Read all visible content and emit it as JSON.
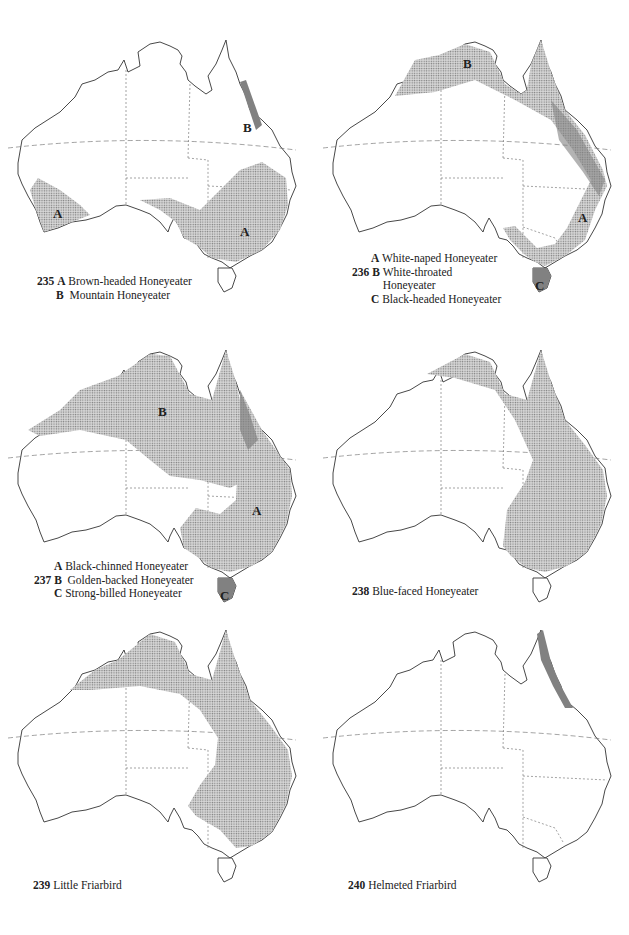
{
  "page": {
    "background": "#ffffff",
    "ink": "#222222",
    "shade": "#9a9a9a"
  },
  "maps": [
    {
      "id": 235,
      "number": "235",
      "captions": [
        {
          "letter": "A",
          "name": "Brown-headed Honeyeater"
        },
        {
          "letter": "B",
          "name": "Mountain Honeyeater"
        }
      ],
      "labels": [
        "A",
        "B",
        "A"
      ]
    },
    {
      "id": 236,
      "number": "236",
      "captions": [
        {
          "letter": "A",
          "name": "White-naped Honeyeater"
        },
        {
          "letter": "B",
          "name": "White-throated Honeyeater"
        },
        {
          "letter": "C",
          "name": "Black-headed Honeyeater"
        }
      ],
      "labels": [
        "B",
        "A",
        "C"
      ]
    },
    {
      "id": 237,
      "number": "237",
      "captions": [
        {
          "letter": "A",
          "name": "Black-chinned Honeyeater"
        },
        {
          "letter": "B",
          "name": "Golden-backed Honeyeater"
        },
        {
          "letter": "C",
          "name": "Strong-billed Honeyeater"
        }
      ],
      "labels": [
        "B",
        "A",
        "C"
      ]
    },
    {
      "id": 238,
      "number": "238",
      "captions": [
        {
          "letter": "",
          "name": "Blue-faced Honeyeater"
        }
      ],
      "labels": []
    },
    {
      "id": 239,
      "number": "239",
      "captions": [
        {
          "letter": "",
          "name": "Little Friarbird"
        }
      ],
      "labels": []
    },
    {
      "id": 240,
      "number": "240",
      "captions": [
        {
          "letter": "",
          "name": "Helmeted Friarbird"
        }
      ],
      "labels": []
    }
  ]
}
